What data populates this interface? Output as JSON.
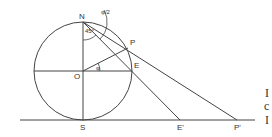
{
  "figure": {
    "labels": {
      "N": "N",
      "P": "P",
      "O": "O",
      "E": "E",
      "S": "S",
      "E_prime": "E'",
      "P_prime": "P'",
      "angle_45": "45°",
      "angle_phi": "φ",
      "angle_phi_half": "φ/2"
    },
    "cropped_text": [
      "I",
      "c",
      "I"
    ]
  }
}
